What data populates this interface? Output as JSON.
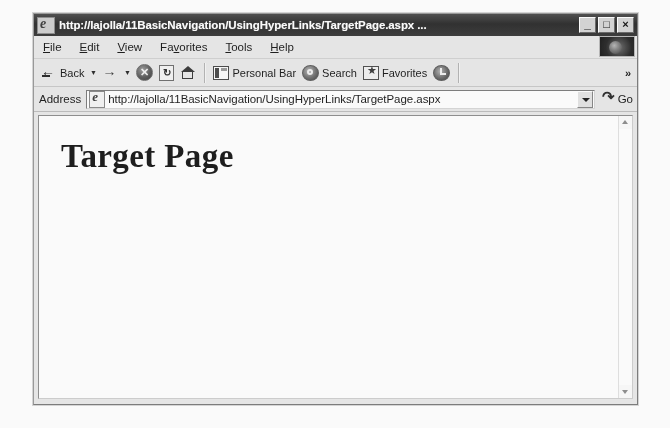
{
  "window": {
    "title": "http://lajolla/11BasicNavigation/UsingHyperLinks/TargetPage.aspx ...",
    "title_icon": "internet-explorer-icon",
    "controls": {
      "minimize": "_",
      "maximize": "□",
      "close": "×"
    }
  },
  "menu": {
    "items": [
      {
        "pre": "",
        "accel": "F",
        "post": "ile"
      },
      {
        "pre": "",
        "accel": "E",
        "post": "dit"
      },
      {
        "pre": "",
        "accel": "V",
        "post": "iew"
      },
      {
        "pre": "Fa",
        "accel": "v",
        "post": "orites"
      },
      {
        "pre": "",
        "accel": "T",
        "post": "ools"
      },
      {
        "pre": "",
        "accel": "H",
        "post": "elp"
      }
    ],
    "logo_name": "internet-explorer-animated-logo"
  },
  "toolbar": {
    "back_label": "Back",
    "back_icon": "back-arrow-icon",
    "back_caret": "▼",
    "forward_icon": "forward-arrow-icon",
    "forward_caret": "▼",
    "stop_icon": "stop-icon",
    "stop_glyph": "✕",
    "refresh_icon": "refresh-icon",
    "refresh_glyph": "↻",
    "home_icon": "home-icon",
    "personal_bar_label": "Personal Bar",
    "personal_bar_icon": "personal-bar-icon",
    "search_label": "Search",
    "search_icon": "search-icon",
    "favorites_label": "Favorites",
    "favorites_icon": "favorites-star-icon",
    "history_icon": "history-icon",
    "overflow_label": "»"
  },
  "address": {
    "label": "Address",
    "page_icon": "page-icon",
    "url": "http://lajolla/11BasicNavigation/UsingHyperLinks/TargetPage.aspx",
    "placeholder": "",
    "dropdown_icon": "chevron-down-icon",
    "go_label": "Go",
    "go_icon": "go-arrow-icon"
  },
  "page": {
    "heading": "Target Page"
  },
  "scrollbar": {
    "up_icon": "scroll-up-arrow-icon",
    "down_icon": "scroll-down-arrow-icon"
  },
  "colors": {
    "titlebar": "#2e2e2e",
    "chrome": "#e9e9e9",
    "content": "#ffffff",
    "text": "#1b1b1b"
  }
}
